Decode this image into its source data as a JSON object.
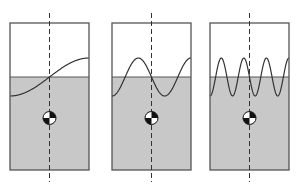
{
  "diagram": {
    "colors": {
      "background": "#ffffff",
      "liquid_fill": "#c8c8c8",
      "outline": "#555555",
      "wave": "#333333",
      "centerline": "#333333",
      "cog_dark": "#111111",
      "cog_light": "#ffffff"
    },
    "tanks": [
      {
        "id": "mode-1",
        "x": 10,
        "width": 79,
        "half_waves": 1
      },
      {
        "id": "mode-2",
        "x": 112,
        "width": 79,
        "half_waves": 3
      },
      {
        "id": "mode-3",
        "x": 210,
        "width": 79,
        "half_waves": 7
      }
    ],
    "geometry": {
      "tank_top": 23,
      "tank_bottom": 170,
      "still_water_level": 77,
      "wave_amplitude": 19,
      "cog_y": 118,
      "cog_radius": 6.5,
      "centerline_top": 13,
      "centerline_bottom": 182
    },
    "symbols": {
      "centerline": "dashed vertical axis of symmetry",
      "cog": "center-of-gravity marker"
    }
  }
}
